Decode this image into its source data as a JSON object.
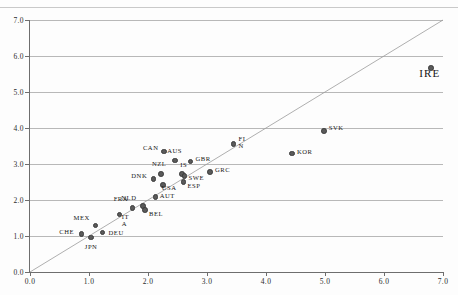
{
  "chart_data": {
    "type": "scatter",
    "title": "",
    "xlabel": "",
    "ylabel": "",
    "xlim": [
      0.0,
      7.0
    ],
    "ylim": [
      0.0,
      7.0
    ],
    "grid": true,
    "legend": "none",
    "xticks": [
      "0.0",
      "1.0",
      "2.0",
      "3.0",
      "4.0",
      "5.0",
      "6.0",
      "7.0"
    ],
    "yticks": [
      "0.0",
      "1.0",
      "2.0",
      "3.0",
      "4.0",
      "5.0",
      "6.0",
      "7.0"
    ],
    "xtickvalues": [
      0.0,
      1.0,
      2.0,
      3.0,
      4.0,
      5.0,
      6.0,
      7.0
    ],
    "ytickvalues": [
      0.0,
      1.0,
      2.0,
      3.0,
      4.0,
      5.0,
      6.0,
      7.0
    ],
    "reference_line": {
      "name": "45-degree-identity-line",
      "from": [
        0.0,
        0.0
      ],
      "to": [
        7.0,
        7.0
      ],
      "color": "#9a9a9a"
    },
    "marker_color": "#5a5a5a",
    "points": [
      {
        "label": "CHE",
        "x": 0.87,
        "y": 1.05,
        "lx": -22,
        "ly": -2
      },
      {
        "label": "JPN",
        "x": 1.03,
        "y": 0.96,
        "lx": -6,
        "ly": 10
      },
      {
        "label": "MEX",
        "x": 1.11,
        "y": 1.29,
        "lx": -22,
        "ly": -8
      },
      {
        "label": "DEU",
        "x": 1.23,
        "y": 1.1,
        "lx": 6,
        "ly": 1
      },
      {
        "label": "IT",
        "x": 1.52,
        "y": 1.6,
        "lx": 2,
        "ly": 3
      },
      {
        "label": "A",
        "x": 1.52,
        "y": 1.6,
        "lx": 2,
        "ly": 10
      },
      {
        "label": "FRA",
        "x": 1.74,
        "y": 1.78,
        "lx": -19,
        "ly": -9
      },
      {
        "label": "NLD",
        "x": 1.92,
        "y": 1.84,
        "lx": -22,
        "ly": -8
      },
      {
        "label": "BEL",
        "x": 1.95,
        "y": 1.72,
        "lx": 4,
        "ly": 4
      },
      {
        "label": "AUT",
        "x": 2.13,
        "y": 2.09,
        "lx": 4,
        "ly": -1
      },
      {
        "label": "DNK",
        "x": 2.09,
        "y": 2.59,
        "lx": -22,
        "ly": -3
      },
      {
        "label": "NZL",
        "x": 2.22,
        "y": 2.73,
        "lx": -9,
        "ly": -10
      },
      {
        "label": "USA",
        "x": 2.25,
        "y": 2.42,
        "lx": -1,
        "ly": 3
      },
      {
        "label": "CAN",
        "x": 2.27,
        "y": 3.35,
        "lx": -21,
        "ly": -3
      },
      {
        "label": "AUS",
        "x": 2.46,
        "y": 3.1,
        "lx": -8,
        "ly": -9
      },
      {
        "label": "IS",
        "x": 2.58,
        "y": 2.73,
        "lx": -2,
        "ly": -9
      },
      {
        "label": "SWE",
        "x": 2.62,
        "y": 2.66,
        "lx": 4,
        "ly": 2
      },
      {
        "label": "ESP",
        "x": 2.6,
        "y": 2.5,
        "lx": 4,
        "ly": 4
      },
      {
        "label": "GBR",
        "x": 2.72,
        "y": 3.07,
        "lx": 5,
        "ly": -2
      },
      {
        "label": "GRC",
        "x": 3.05,
        "y": 2.78,
        "lx": 5,
        "ly": -2
      },
      {
        "label": "FI",
        "x": 3.45,
        "y": 3.56,
        "lx": 5,
        "ly": -5
      },
      {
        "label": "N",
        "x": 3.45,
        "y": 3.56,
        "lx": 5,
        "ly": 2
      },
      {
        "label": "SVK",
        "x": 4.98,
        "y": 3.91,
        "lx": 5,
        "ly": -3
      },
      {
        "label": "KOR",
        "x": 4.44,
        "y": 3.29,
        "lx": 5,
        "ly": -2
      },
      {
        "label": "IRE",
        "x": 6.8,
        "y": 5.67,
        "lx": -12,
        "ly": 6,
        "big": true
      }
    ]
  }
}
